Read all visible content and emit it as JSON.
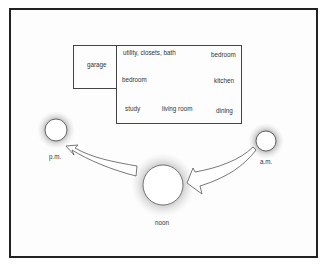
{
  "diagram": {
    "title": "",
    "house": {
      "garage": {
        "label": "garage"
      },
      "rooms": [
        {
          "id": "utility",
          "label": "utility, closets, bath"
        },
        {
          "id": "bedroom-ne",
          "label": "bedroom"
        },
        {
          "id": "bedroom-w",
          "label": "bedroom"
        },
        {
          "id": "kitchen",
          "label": "kitchen"
        },
        {
          "id": "study",
          "label": "study"
        },
        {
          "id": "living-room",
          "label": "living room"
        },
        {
          "id": "dining",
          "label": "dining"
        }
      ]
    },
    "suns": [
      {
        "id": "pm",
        "label": "p.m."
      },
      {
        "id": "noon",
        "label": "noon"
      },
      {
        "id": "am",
        "label": "a.m."
      }
    ],
    "arrows": [
      {
        "id": "am-to-noon",
        "from": "a.m.",
        "to": "noon"
      },
      {
        "id": "noon-to-pm",
        "from": "noon",
        "to": "p.m."
      }
    ],
    "colors": {
      "line": "#444444",
      "frame": "#222222",
      "background": "#ffffff"
    }
  }
}
